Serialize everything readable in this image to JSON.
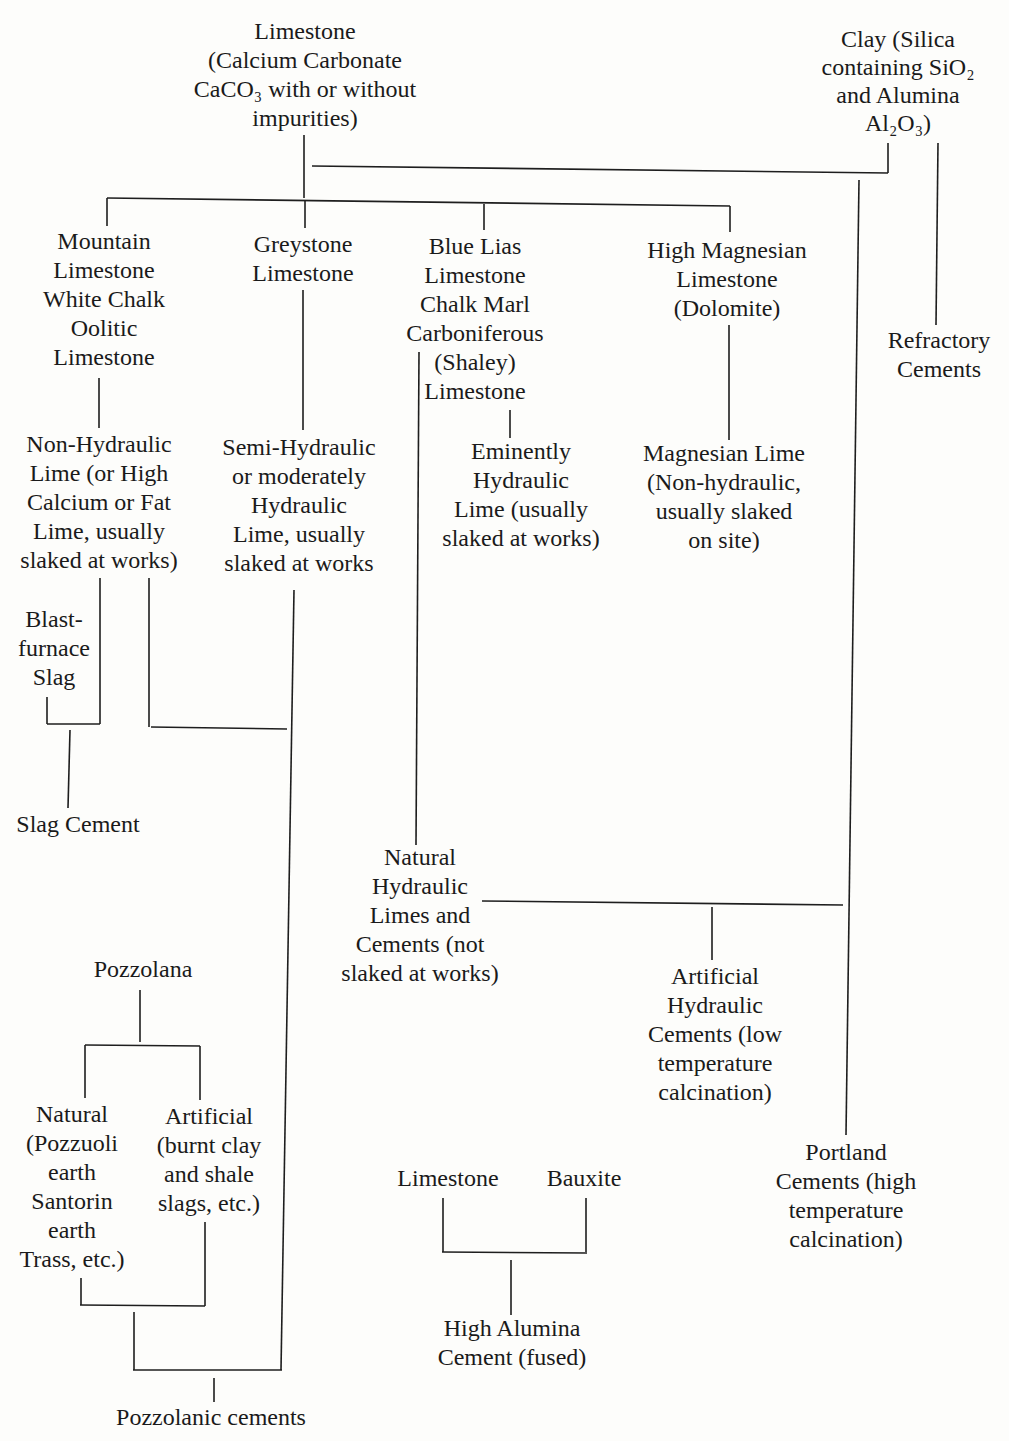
{
  "nodes": {
    "limestone_top": {
      "lines": [
        "Limestone",
        "(Calcium Carbonate",
        "CaCO₃ with or without",
        "impurities)"
      ]
    },
    "clay": {
      "lines": [
        "Clay (Silica",
        "containing SiO₂",
        "and Alumina",
        "Al₂O₃)"
      ]
    },
    "mountain_limestone": {
      "lines": [
        "Mountain",
        "Limestone",
        "White Chalk",
        "Oolitic",
        "Limestone"
      ]
    },
    "greystone_limestone": {
      "lines": [
        "Greystone",
        "Limestone"
      ]
    },
    "blue_lias": {
      "lines": [
        "Blue Lias",
        "Limestone",
        "Chalk Marl",
        "Carboniferous",
        "(Shaley)",
        "Limestone"
      ]
    },
    "high_magnesian": {
      "lines": [
        "High Magnesian",
        "Limestone",
        "(Dolomite)"
      ]
    },
    "refractory_cements": {
      "lines": [
        "Refractory",
        "Cements"
      ]
    },
    "non_hydraulic_lime": {
      "lines": [
        "Non-Hydraulic",
        "Lime (or High",
        "Calcium or Fat",
        "Lime, usually",
        "slaked at works)"
      ]
    },
    "semi_hydraulic_lime": {
      "lines": [
        "Semi-Hydraulic",
        "or moderately",
        "Hydraulic",
        "Lime, usually",
        "slaked at works"
      ]
    },
    "eminently_hydraulic_lime": {
      "lines": [
        "Eminently",
        "Hydraulic",
        "Lime (usually",
        "slaked at works)"
      ]
    },
    "magnesian_lime": {
      "lines": [
        "Magnesian Lime",
        "(Non-hydraulic,",
        "usually slaked",
        "on site)"
      ]
    },
    "blast_furnace_slag": {
      "lines": [
        "Blast-",
        "furnace",
        "Slag"
      ]
    },
    "slag_cement": {
      "lines": [
        "Slag Cement"
      ]
    },
    "natural_hydraulic_limes": {
      "lines": [
        "Natural",
        "Hydraulic",
        "Limes and",
        "Cements (not",
        "slaked at works)"
      ]
    },
    "artificial_hydraulic_cements": {
      "lines": [
        "Artificial",
        "Hydraulic",
        "Cements (low",
        "temperature",
        "calcination)"
      ]
    },
    "pozzolana": {
      "lines": [
        "Pozzolana"
      ]
    },
    "natural_pozzolana": {
      "lines": [
        "Natural",
        "(Pozzuoli",
        "earth",
        "Santorin",
        "earth",
        "Trass, etc.)"
      ]
    },
    "artificial_pozzolana": {
      "lines": [
        "Artificial",
        "(burnt clay",
        "and shale",
        "slags, etc.)"
      ]
    },
    "portland_cements": {
      "lines": [
        "Portland",
        "Cements (high",
        "temperature",
        "calcination)"
      ]
    },
    "limestone_bottom": {
      "lines": [
        "Limestone"
      ]
    },
    "bauxite": {
      "lines": [
        "Bauxite"
      ]
    },
    "high_alumina_cement": {
      "lines": [
        "High Alumina",
        "Cement (fused)"
      ]
    },
    "pozzolanic_cements": {
      "lines": [
        "Pozzolanic cements"
      ]
    }
  },
  "colors": {
    "ink": "#1e1e1e",
    "paper": "#fdfdfb"
  }
}
